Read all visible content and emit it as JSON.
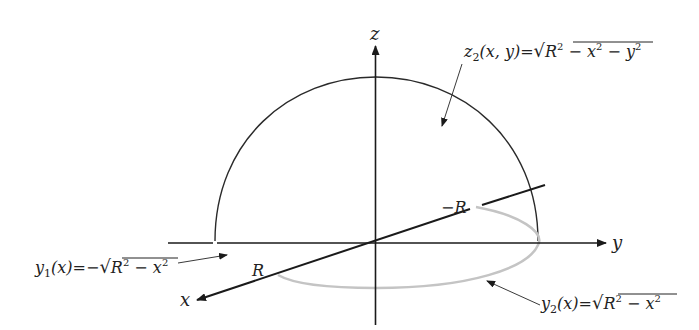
{
  "figure": {
    "colors": {
      "axes": "#1a1a1a",
      "hemisphere_arc": "#2a2a2a",
      "base_curve": "#c4c4c4",
      "annotation_arrow": "#3a3a3a",
      "text": "#222222",
      "background": "#ffffff"
    },
    "axes": {
      "x_label": "x",
      "y_label": "y",
      "z_label": "z"
    },
    "points": {
      "R_label": "R",
      "neg_R_label": "−R"
    },
    "annotations": {
      "z2": {
        "name": "z",
        "subscript": "2",
        "args": "(x, y)",
        "equals": "=",
        "radical": "√",
        "radicand_R": "R",
        "radicand_rest_1": " − x",
        "radicand_rest_2": " − y",
        "exp": "2"
      },
      "y1": {
        "name": "y",
        "subscript": "1",
        "args": "(x)",
        "equals": "=",
        "sign": "−",
        "radical": "√",
        "radicand_R": "R",
        "radicand_rest_1": " − x",
        "exp": "2"
      },
      "y2": {
        "name": "y",
        "subscript": "2",
        "args": "(x)",
        "equals": "=",
        "radical": "√",
        "radicand_R": "R",
        "radicand_rest_1": " − x",
        "exp": "2"
      }
    }
  }
}
